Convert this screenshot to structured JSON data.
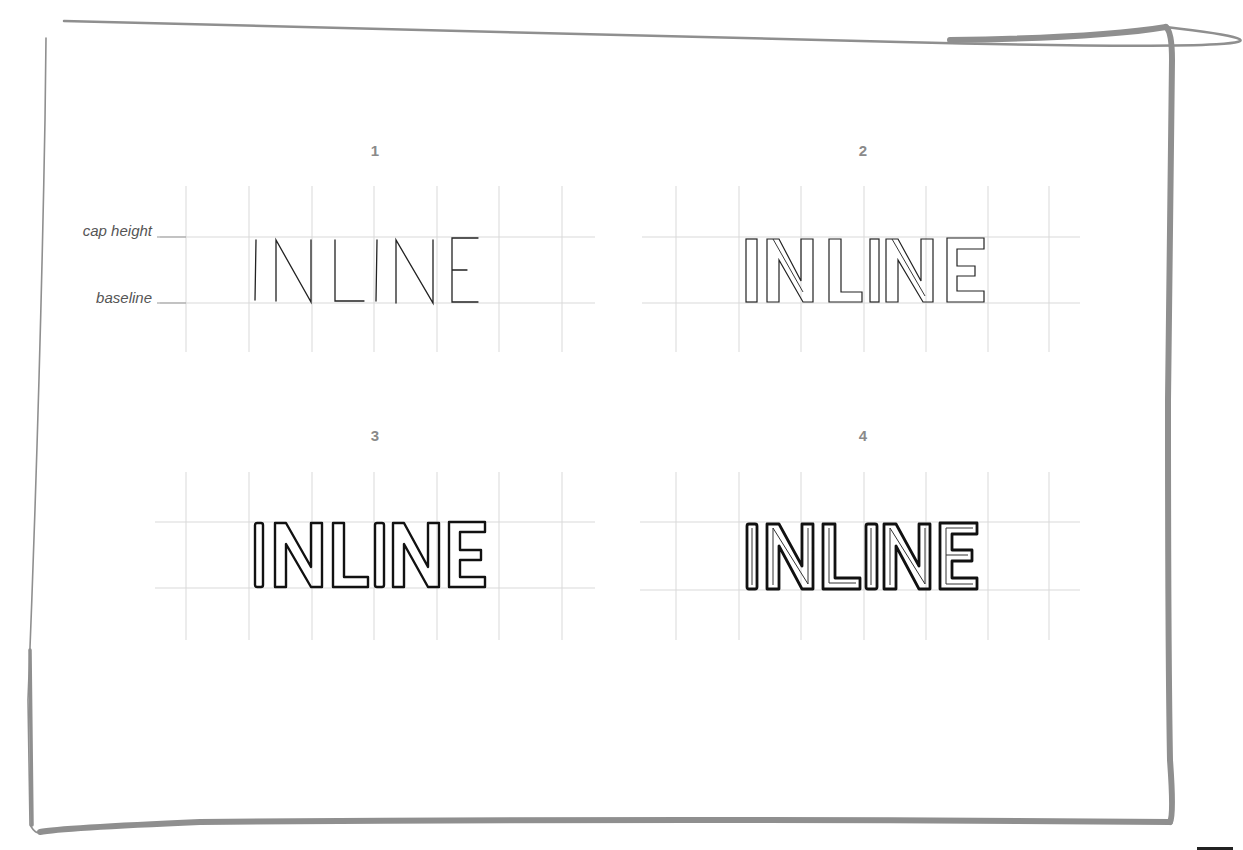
{
  "labels": {
    "cap_height": "cap height",
    "baseline": "baseline"
  },
  "colors": {
    "frame": "#8f8f8f",
    "grid": "#d6d6d6",
    "ink": "#111111",
    "panel_number": "#8a8a8a",
    "label": "#555555"
  },
  "panels": [
    {
      "number": "1",
      "word": "INLINE",
      "style": "single-stroke skeleton",
      "num_x": 375,
      "num_y": 142,
      "grid": {
        "x_lines": [
          186,
          249,
          312,
          374,
          437,
          499,
          562
        ],
        "y_top": 186,
        "y_bottom": 352,
        "h_left": 160,
        "h_right": 595,
        "cap_y": 237,
        "base_y": 303
      }
    },
    {
      "number": "2",
      "word": "INLINE",
      "style": "thin outline with inline stroke",
      "num_x": 863,
      "num_y": 142,
      "grid": {
        "x_lines": [
          676,
          739,
          801,
          864,
          926,
          988,
          1049
        ],
        "y_top": 186,
        "y_bottom": 352,
        "h_left": 642,
        "h_right": 1080,
        "cap_y": 237,
        "base_y": 303
      }
    },
    {
      "number": "3",
      "word": "INLINE",
      "style": "bold outline",
      "num_x": 375,
      "num_y": 427,
      "grid": {
        "x_lines": [
          186,
          249,
          312,
          374,
          437,
          499,
          562
        ],
        "y_top": 472,
        "y_bottom": 640,
        "h_left": 155,
        "h_right": 595,
        "cap_y": 522,
        "base_y": 588
      }
    },
    {
      "number": "4",
      "word": "INLINE",
      "style": "bold outline with inline",
      "num_x": 863,
      "num_y": 427,
      "grid": {
        "x_lines": [
          676,
          739,
          801,
          864,
          926,
          988,
          1049
        ],
        "y_top": 472,
        "y_bottom": 640,
        "h_left": 640,
        "h_right": 1080,
        "cap_y": 522,
        "base_y": 590
      }
    }
  ]
}
